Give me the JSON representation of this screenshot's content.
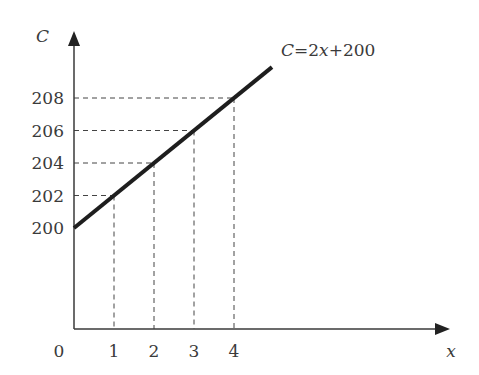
{
  "chart_data": {
    "type": "line",
    "title": "",
    "xlabel": "x",
    "ylabel": "C",
    "origin_label": "0",
    "xlim": [
      0,
      4.95
    ],
    "ylim_visible_ticks": [
      200,
      208
    ],
    "x_ticks": [
      1,
      2,
      3,
      4
    ],
    "x_tick_labels": [
      "1",
      "2",
      "3",
      "4"
    ],
    "y_ticks": [
      200,
      202,
      204,
      206,
      208
    ],
    "y_tick_labels": [
      "200",
      "202",
      "204",
      "206",
      "208"
    ],
    "series": [
      {
        "name": "C=2x+200",
        "equation": "C = 2x + 200",
        "slope": 2,
        "intercept": 200,
        "x": [
          0,
          4.95
        ],
        "y": [
          200,
          209.9
        ]
      }
    ],
    "guide_points": [
      {
        "x": 1,
        "y": 202
      },
      {
        "x": 2,
        "y": 204
      },
      {
        "x": 3,
        "y": 206
      },
      {
        "x": 4,
        "y": 208
      }
    ],
    "annotations": [
      {
        "text_parts": [
          "C",
          "=2",
          "x",
          "+200"
        ],
        "near": "line-end"
      }
    ],
    "grid": false,
    "legend": "none"
  }
}
